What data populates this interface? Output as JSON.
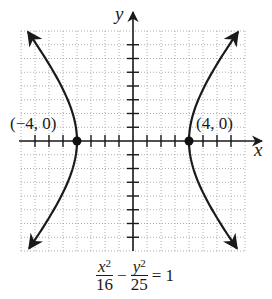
{
  "chart_data": {
    "type": "line",
    "title": "",
    "equation": {
      "term1_num": "x",
      "term1_exp": "2",
      "term1_den": "16",
      "operator": "−",
      "term2_num": "y",
      "term2_exp": "2",
      "term2_den": "25",
      "rhs": "= 1"
    },
    "xlabel": "x",
    "ylabel": "y",
    "xlim": [
      -8,
      8
    ],
    "ylim": [
      -8,
      8
    ],
    "grid": true,
    "series": [
      {
        "name": "right branch",
        "function": "x = 4*sqrt(1 + y^2/25)",
        "points": [
          [
            7.55,
            8
          ],
          [
            5.66,
            5
          ],
          [
            4.31,
            2
          ],
          [
            4,
            0
          ],
          [
            4.31,
            -2
          ],
          [
            5.66,
            -5
          ],
          [
            7.55,
            -8
          ]
        ]
      },
      {
        "name": "left branch",
        "function": "x = -4*sqrt(1 + y^2/25)",
        "points": [
          [
            -7.55,
            8
          ],
          [
            -5.66,
            5
          ],
          [
            -4.31,
            2
          ],
          [
            -4,
            0
          ],
          [
            -4.31,
            -2
          ],
          [
            -5.66,
            -5
          ],
          [
            -7.55,
            -8
          ]
        ]
      }
    ],
    "annotations": [
      {
        "text": "(−4, 0)",
        "x": -4,
        "y": 0
      },
      {
        "text": "(4, 0)",
        "x": 4,
        "y": 0
      }
    ]
  },
  "labels": {
    "vertex_left": "(−4, 0)",
    "vertex_right": "(4, 0)",
    "x_axis": "x",
    "y_axis": "y"
  }
}
